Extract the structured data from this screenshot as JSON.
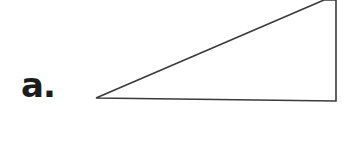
{
  "figure": {
    "label": "a.",
    "shape": "right-triangle",
    "stroke_color": "#3a3a3a",
    "fill_color": "#ffffff",
    "vertices": [
      [
        96,
        98
      ],
      [
        324,
        0
      ],
      [
        336,
        101
      ]
    ]
  }
}
